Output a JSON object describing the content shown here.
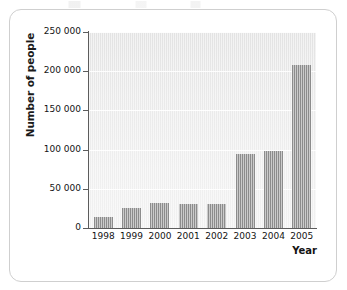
{
  "chart_data": {
    "type": "bar",
    "title": "",
    "xlabel": "Year",
    "ylabel": "Number of people",
    "categories": [
      "1998",
      "1999",
      "2000",
      "2001",
      "2002",
      "2003",
      "2004",
      "2005"
    ],
    "values": [
      14000,
      25000,
      32000,
      31000,
      31000,
      95000,
      98000,
      208000
    ],
    "ylim": [
      0,
      250000
    ],
    "ytick_values": [
      0,
      50000,
      100000,
      150000,
      200000,
      250000
    ],
    "ytick_labels": [
      "0",
      "50 000",
      "100 000",
      "150 000",
      "200 000",
      "250 000"
    ],
    "grid": true,
    "legend": null,
    "bar_color": "#8c8c8c",
    "plot_background": "#e9e9e9",
    "axis_color": "#5c5c5c",
    "gridline_color": "#ffffff"
  },
  "figure": {
    "y_axis_title": "Number of people",
    "x_axis_title": "Year",
    "border_color": "#cfcfcf"
  }
}
